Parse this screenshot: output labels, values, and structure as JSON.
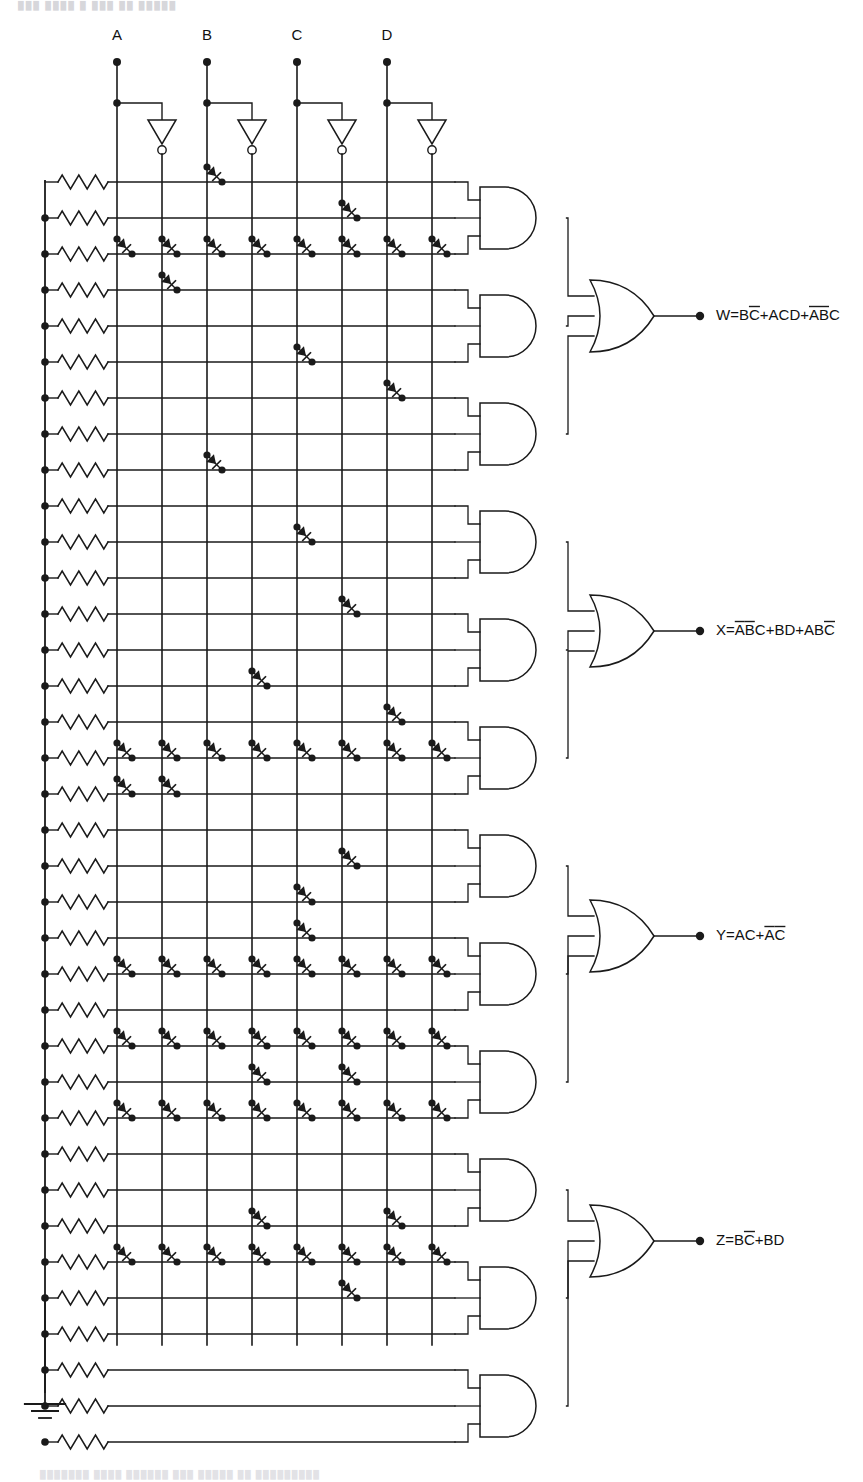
{
  "inputs": {
    "labels": [
      "A",
      "B",
      "C",
      "D"
    ],
    "count": 4
  },
  "columns": {
    "count": 8,
    "names": [
      "A",
      "A-bar",
      "B",
      "B-bar",
      "C",
      "C-bar",
      "D",
      "D-bar"
    ],
    "x": [
      117,
      162,
      207,
      252,
      297,
      342,
      387,
      432
    ]
  },
  "rows": {
    "count": 32,
    "y": [
      182,
      218,
      254,
      290,
      326,
      362,
      398,
      434,
      470,
      506,
      542,
      578,
      614,
      650,
      686,
      722,
      758,
      794,
      830,
      866,
      902,
      938,
      974,
      1010,
      1046,
      1082,
      1118,
      1154,
      1190,
      1226,
      1262,
      1298
    ],
    "resistor_label": "pull-down resistor"
  },
  "matrix": {
    "note": "Each entry lists the column indices (0-7) carrying a diode on that product-term row",
    "diodes": [
      [
        2
      ],
      [
        5
      ],
      [
        0,
        1,
        2,
        3,
        4,
        5,
        6,
        7
      ],
      [
        1
      ],
      [],
      [
        4
      ],
      [
        6
      ],
      [],
      [
        2
      ],
      [],
      [
        4
      ],
      [],
      [
        5
      ],
      [],
      [
        3
      ],
      [
        6
      ],
      [
        0,
        1,
        2,
        3,
        4,
        5,
        6,
        7
      ],
      [
        0,
        1
      ],
      [],
      [
        5
      ],
      [],
      [
        4
      ],
      [
        0,
        1,
        2,
        3,
        4,
        5,
        6,
        7
      ],
      [],
      [
        2
      ],
      [
        5
      ],
      [
        0,
        1,
        2,
        3,
        4,
        5,
        6,
        7
      ],
      [],
      [],
      [
        3
      ],
      [],
      [
        5
      ]
    ],
    "diodes_lower": [
      [
        4
      ],
      [],
      [
        6
      ],
      [],
      [
        0,
        1,
        2,
        3,
        4,
        5,
        6,
        7
      ],
      [
        3
      ],
      [],
      [],
      [],
      [
        6
      ],
      [
        0,
        1,
        2,
        3,
        4,
        5,
        6,
        7
      ],
      []
    ]
  },
  "and_gates": {
    "count": 12,
    "label": "AND gate",
    "inputs_per_gate": 3,
    "y": [
      218,
      326,
      434,
      542,
      650,
      758,
      866,
      974,
      1082,
      1190,
      1298,
      1406
    ]
  },
  "or_gates": {
    "count": 4,
    "label": "OR gate",
    "inputs_per_gate": 3
  },
  "inverters": {
    "count": 4,
    "label": "inverting buffer"
  },
  "ground": {
    "label": "ground"
  },
  "outputs": [
    {
      "name": "W",
      "y": 316,
      "parts": [
        {
          "t": "W=B",
          "bar": false
        },
        {
          "t": "C",
          "bar": true
        },
        {
          "t": "+ACD+",
          "bar": false
        },
        {
          "t": "A",
          "bar": true
        },
        {
          "t": "B",
          "bar": true
        },
        {
          "t": "C",
          "bar": false
        }
      ],
      "plain": "W=BC̅+ACD+A̅B̅C"
    },
    {
      "name": "X",
      "y": 631,
      "parts": [
        {
          "t": "X=",
          "bar": false
        },
        {
          "t": "A",
          "bar": true
        },
        {
          "t": "B",
          "bar": true
        },
        {
          "t": "C+BD+AB",
          "bar": false
        },
        {
          "t": "C",
          "bar": true
        }
      ],
      "plain": "X=A̅B̅C+BD+ABC̅"
    },
    {
      "name": "Y",
      "y": 936,
      "parts": [
        {
          "t": "Y=AC+",
          "bar": false
        },
        {
          "t": "A",
          "bar": true
        },
        {
          "t": "C",
          "bar": true
        }
      ],
      "plain": "Y=AC+A̅C̅"
    },
    {
      "name": "Z",
      "y": 1241,
      "parts": [
        {
          "t": "Z=B",
          "bar": false
        },
        {
          "t": "C",
          "bar": true
        },
        {
          "t": "+BD",
          "bar": false
        }
      ],
      "plain": "Z=BC̅+BD"
    }
  ],
  "colors": {
    "ink": "#1a1a1a",
    "background": "#ffffff",
    "faint_scan": "#d7d7db"
  }
}
